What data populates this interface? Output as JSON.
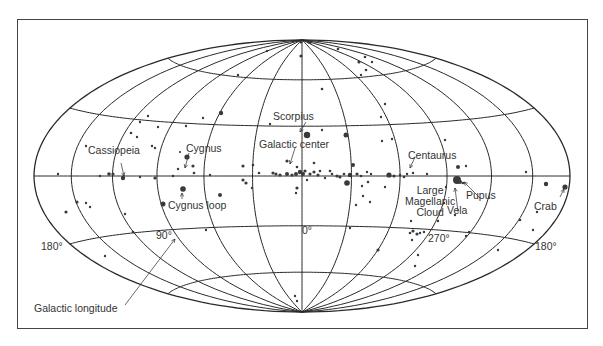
{
  "diagram": {
    "projection": "Hammer-Aitoff (galactic coordinates)",
    "colors": {
      "line": "#2a2a2a",
      "dot": "#3a3a3a",
      "text": "#333333",
      "frame": "#444444"
    },
    "geometry": {
      "cx": 302,
      "cy": 176,
      "rx": 268,
      "ry": 136
    },
    "meridian_step_deg": 30,
    "parallels_deg": [
      -60,
      -30,
      0,
      30,
      60
    ],
    "longitude_axis": {
      "label": "Galactic longitude",
      "ticks": [
        {
          "text": "180°",
          "x": 41,
          "y": 241
        },
        {
          "text": "90°",
          "x": 156,
          "y": 230
        },
        {
          "text": "0°",
          "x": 302,
          "y": 225
        },
        {
          "text": "270°",
          "x": 428,
          "y": 233
        },
        {
          "text": "180°",
          "x": 535,
          "y": 241
        }
      ]
    },
    "labels": [
      {
        "id": "scorpius",
        "text": "Scorpius",
        "x": 273,
        "y": 111
      },
      {
        "id": "galactic-center",
        "text": "Galactic center",
        "x": 259,
        "y": 139
      },
      {
        "id": "cassiopeia",
        "text": "Cassiopeia",
        "x": 88,
        "y": 145
      },
      {
        "id": "cygnus",
        "text": "Cygnus",
        "x": 186,
        "y": 143
      },
      {
        "id": "cygnus-loop",
        "text": "Cygnus loop",
        "x": 168,
        "y": 200
      },
      {
        "id": "centaurus",
        "text": "Centaurus",
        "x": 408,
        "y": 150
      },
      {
        "id": "large-magellanic-cloud",
        "text": "Large\nMagellanic\nCloud",
        "x": 405,
        "y": 185
      },
      {
        "id": "vela",
        "text": "Vela",
        "x": 447,
        "y": 205
      },
      {
        "id": "pupus",
        "text": "Pupus",
        "x": 466,
        "y": 190
      },
      {
        "id": "crab",
        "text": "Crab",
        "x": 534,
        "y": 201
      },
      {
        "id": "galactic-longitude",
        "text": "Galactic longitude",
        "x": 34,
        "y": 303
      }
    ],
    "arrows": [
      {
        "from": [
          306,
          122
        ],
        "to": [
          300,
          132
        ]
      },
      {
        "from": [
          295,
          148
        ],
        "to": [
          290,
          164
        ]
      },
      {
        "from": [
          121,
          163
        ],
        "to": [
          124,
          176
        ]
      },
      {
        "from": [
          189,
          153
        ],
        "to": [
          185,
          168
        ]
      },
      {
        "from": [
          182,
          199
        ],
        "to": [
          182,
          193
        ]
      },
      {
        "from": [
          415,
          157
        ],
        "to": [
          410,
          168
        ]
      },
      {
        "from": [
          458,
          212
        ],
        "to": [
          455,
          188
        ]
      },
      {
        "from": [
          480,
          198
        ],
        "to": [
          464,
          182
        ]
      },
      {
        "from": [
          560,
          197
        ],
        "to": [
          564,
          189
        ]
      },
      {
        "from": [
          125,
          305
        ],
        "to": [
          175,
          239
        ]
      }
    ],
    "sources": [
      [
        310,
        42,
        2
      ],
      [
        301,
        56,
        1.6
      ],
      [
        338,
        49,
        1.3
      ],
      [
        359,
        62,
        1.6
      ],
      [
        365,
        57,
        1.3
      ],
      [
        366,
        70,
        1.3
      ],
      [
        372,
        62,
        1.2
      ],
      [
        361,
        75,
        1.2
      ],
      [
        267,
        51,
        1.2
      ],
      [
        238,
        75,
        1.2
      ],
      [
        322,
        89,
        1.3
      ],
      [
        221,
        113,
        2.2
      ],
      [
        148,
        116,
        1.2
      ],
      [
        140,
        122,
        1.2
      ],
      [
        158,
        127,
        1.2
      ],
      [
        131,
        133,
        1.3
      ],
      [
        137,
        137,
        1.2
      ],
      [
        186,
        126,
        1.2
      ],
      [
        203,
        118,
        1.2
      ],
      [
        270,
        124,
        1.2
      ],
      [
        381,
        117,
        1.2
      ],
      [
        392,
        139,
        1.2
      ],
      [
        382,
        141,
        1.2
      ],
      [
        385,
        104,
        1.2
      ],
      [
        445,
        140,
        1.2
      ],
      [
        346,
        135,
        2.5
      ],
      [
        307,
        135,
        3.2
      ],
      [
        322,
        130,
        1.2
      ],
      [
        86,
        146,
        1.2
      ],
      [
        152,
        146,
        1.2
      ],
      [
        155,
        148,
        1.2
      ],
      [
        180,
        152,
        1.1
      ],
      [
        187,
        157,
        2.6
      ],
      [
        193,
        166,
        1.6
      ],
      [
        178,
        169,
        1.2
      ],
      [
        109,
        174,
        1.8
      ],
      [
        113,
        174,
        1.6
      ],
      [
        100,
        176,
        1.2
      ],
      [
        123,
        178,
        2.2
      ],
      [
        58,
        174,
        1.2
      ],
      [
        140,
        177,
        1.2
      ],
      [
        155,
        178,
        1.6
      ],
      [
        173,
        176,
        1.3
      ],
      [
        194,
        173,
        1.3
      ],
      [
        243,
        166,
        1.6
      ],
      [
        253,
        165,
        1.3
      ],
      [
        243,
        180,
        1.6
      ],
      [
        246,
        183,
        1.6
      ],
      [
        252,
        188,
        1.2
      ],
      [
        259,
        173,
        1.3
      ],
      [
        273,
        173,
        1.6
      ],
      [
        276,
        174,
        1.6
      ],
      [
        280,
        175,
        1.6
      ],
      [
        287,
        174,
        2
      ],
      [
        292,
        175,
        1.6
      ],
      [
        296,
        174,
        2
      ],
      [
        300,
        172,
        2.2
      ],
      [
        303,
        174,
        2
      ],
      [
        305,
        171,
        1.6
      ],
      [
        310,
        174,
        1.6
      ],
      [
        314,
        172,
        1.6
      ],
      [
        318,
        175,
        1.6
      ],
      [
        320,
        171,
        1.3
      ],
      [
        287,
        161,
        1.6
      ],
      [
        297,
        167,
        1.3
      ],
      [
        314,
        163,
        1.3
      ],
      [
        330,
        171,
        1.3
      ],
      [
        332,
        174,
        1.3
      ],
      [
        325,
        178,
        1.2
      ],
      [
        337,
        176,
        1.6
      ],
      [
        340,
        177,
        1.6
      ],
      [
        344,
        174,
        1.3
      ],
      [
        350,
        175,
        2.2
      ],
      [
        353,
        165,
        2
      ],
      [
        347,
        183,
        2.8
      ],
      [
        297,
        188,
        1.6
      ],
      [
        296,
        193,
        1.2
      ],
      [
        307,
        180,
        1.2
      ],
      [
        357,
        174,
        1.6
      ],
      [
        361,
        176,
        1.3
      ],
      [
        367,
        172,
        1.2
      ],
      [
        368,
        182,
        1.3
      ],
      [
        362,
        186,
        1.2
      ],
      [
        371,
        174,
        1.2
      ],
      [
        389,
        175,
        2.6
      ],
      [
        394,
        176,
        1.6
      ],
      [
        400,
        175,
        1.2
      ],
      [
        404,
        177,
        1.3
      ],
      [
        413,
        173,
        1.2
      ],
      [
        407,
        174,
        1.2
      ],
      [
        385,
        187,
        1.2
      ],
      [
        356,
        205,
        1.2
      ],
      [
        363,
        196,
        1.2
      ],
      [
        427,
        174,
        1.2
      ],
      [
        457,
        180,
        4
      ],
      [
        460,
        182,
        2
      ],
      [
        463,
        183,
        1.3
      ],
      [
        458,
        167,
        2
      ],
      [
        466,
        166,
        1.2
      ],
      [
        446,
        187,
        1.2
      ],
      [
        444,
        203,
        1.2
      ],
      [
        455,
        215,
        1.2
      ],
      [
        438,
        221,
        1.2
      ],
      [
        411,
        221,
        1.2
      ],
      [
        526,
        172,
        1.2
      ],
      [
        546,
        184,
        2.2
      ],
      [
        565,
        187,
        2.6
      ],
      [
        520,
        220,
        1.3
      ],
      [
        533,
        230,
        1.2
      ],
      [
        537,
        212,
        1.2
      ],
      [
        498,
        250,
        1.2
      ],
      [
        469,
        232,
        1.2
      ],
      [
        466,
        236,
        1.2
      ],
      [
        410,
        233,
        1.3
      ],
      [
        413,
        231,
        1.6
      ],
      [
        417,
        234,
        1.6
      ],
      [
        420,
        233,
        1.2
      ],
      [
        424,
        232,
        1.2
      ],
      [
        412,
        240,
        1.2
      ],
      [
        418,
        255,
        1.2
      ],
      [
        415,
        266,
        1.2
      ],
      [
        378,
        250,
        1.6
      ],
      [
        370,
        202,
        1.2
      ],
      [
        350,
        228,
        1.2
      ],
      [
        66,
        212,
        1.6
      ],
      [
        77,
        202,
        1.6
      ],
      [
        86,
        203,
        1.2
      ],
      [
        90,
        207,
        1.2
      ],
      [
        125,
        214,
        1.2
      ],
      [
        105,
        256,
        1.2
      ],
      [
        163,
        204,
        2.5
      ],
      [
        183,
        189,
        2.8
      ],
      [
        220,
        195,
        2
      ],
      [
        206,
        230,
        1.2
      ],
      [
        133,
        232,
        1.3
      ],
      [
        210,
        175,
        1.2
      ],
      [
        297,
        301,
        1.2
      ],
      [
        295,
        296,
        1.2
      ],
      [
        301,
        42,
        1.6
      ]
    ]
  }
}
